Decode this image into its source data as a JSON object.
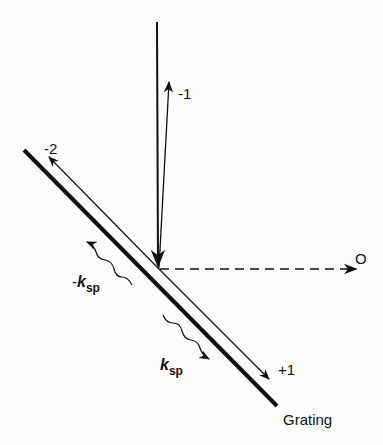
{
  "diagram": {
    "labels": {
      "order_minus1": "-1",
      "order_minus2": "-2",
      "order_zero": "O",
      "order_plus1": "+1",
      "grating": "Grating",
      "minus_k_sign": "-",
      "k_symbol": "k",
      "k_sub": "sp",
      "k2_symbol": "k",
      "k2_sub": "sp"
    },
    "elements": [
      {
        "id": "grating",
        "type": "thick-line",
        "from": [
          24,
          150
        ],
        "to": [
          277,
          406
        ]
      },
      {
        "id": "incident-beam",
        "type": "arrow",
        "from": [
          157,
          22
        ],
        "to": [
          158,
          268
        ]
      },
      {
        "id": "order-minus1",
        "type": "arrow",
        "from": [
          158,
          268
        ],
        "to": [
          169,
          80
        ]
      },
      {
        "id": "order-zero",
        "type": "dashed-arrow",
        "from": [
          160,
          269
        ],
        "to": [
          358,
          269
        ]
      },
      {
        "id": "order-minus2",
        "type": "arrow",
        "from": [
          158,
          268
        ],
        "to": [
          48,
          156
        ]
      },
      {
        "id": "order-plus1",
        "type": "arrow",
        "from": [
          158,
          268
        ],
        "to": [
          270,
          378
        ]
      },
      {
        "id": "minus-ksp",
        "type": "wavy-arrow",
        "toward": "upper-left"
      },
      {
        "id": "ksp",
        "type": "wavy-arrow",
        "toward": "lower-right"
      }
    ],
    "colors": {
      "ink": "#111111",
      "background": "#fdfdfd"
    }
  }
}
